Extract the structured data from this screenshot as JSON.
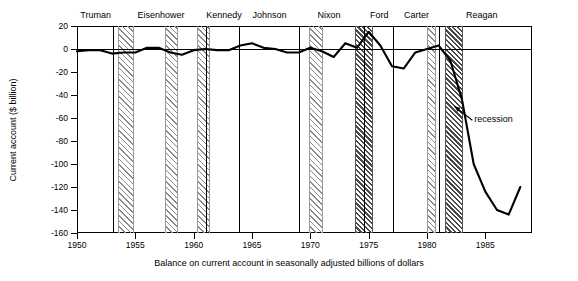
{
  "chart_data": {
    "type": "line",
    "title": "",
    "xlabel": "Balance on current account in seasonally adjusted billions of dollars",
    "ylabel": "Current account ($ billion)",
    "xlim": [
      1950,
      1989
    ],
    "ylim": [
      -160,
      20
    ],
    "xticks": [
      1950,
      1955,
      1960,
      1965,
      1970,
      1975,
      1980,
      1985
    ],
    "yticks": [
      20,
      0,
      -20,
      -40,
      -60,
      -80,
      -100,
      -120,
      -140,
      -160
    ],
    "grid": false,
    "legend": null,
    "annotations": [
      {
        "text": "recession",
        "x": 1983.2,
        "y": -62
      }
    ],
    "series": [
      {
        "name": "Current account balance",
        "x": [
          1950,
          1951,
          1952,
          1953,
          1954,
          1955,
          1956,
          1957,
          1958,
          1959,
          1960,
          1961,
          1962,
          1963,
          1964,
          1965,
          1966,
          1967,
          1968,
          1969,
          1970,
          1971,
          1972,
          1973,
          1974,
          1975,
          1976,
          1977,
          1978,
          1979,
          1980,
          1981,
          1982,
          1983,
          1984,
          1985,
          1986,
          1987,
          1988
        ],
        "values": [
          -2,
          -1,
          -1,
          -4,
          -3,
          -3,
          1,
          1,
          -3,
          -5,
          -1,
          0,
          -1,
          -1,
          3,
          5,
          1,
          0,
          -3,
          -3,
          1,
          -2,
          -7,
          5,
          1,
          15,
          3,
          -15,
          -17,
          -3,
          0,
          3,
          -10,
          -44,
          -100,
          -124,
          -140,
          -144,
          -120
        ]
      }
    ],
    "recessions": [
      {
        "start": 1953.5,
        "end": 1954.7,
        "shade": "light"
      },
      {
        "start": 1957.5,
        "end": 1958.5,
        "shade": "light"
      },
      {
        "start": 1960.3,
        "end": 1961.2,
        "shade": "light"
      },
      {
        "start": 1969.9,
        "end": 1970.9,
        "shade": "light"
      },
      {
        "start": 1973.8,
        "end": 1975.2,
        "shade": "dark"
      },
      {
        "start": 1980.0,
        "end": 1980.6,
        "shade": "light"
      },
      {
        "start": 1981.5,
        "end": 1982.9,
        "shade": "dark"
      }
    ],
    "president_terms": [
      {
        "name": "Truman",
        "start": 1950.0,
        "end": 1953.05,
        "center": 1951.6
      },
      {
        "name": "Eisenhower",
        "start": 1953.05,
        "end": 1961.05,
        "center": 1957.2
      },
      {
        "name": "Kennedy",
        "start": 1961.05,
        "end": 1963.9,
        "center": 1962.6
      },
      {
        "name": "Johnson",
        "start": 1963.9,
        "end": 1969.05,
        "center": 1966.5
      },
      {
        "name": "Nixon",
        "start": 1969.05,
        "end": 1974.6,
        "center": 1971.6
      },
      {
        "name": "Ford",
        "start": 1974.6,
        "end": 1977.05,
        "center": 1975.9
      },
      {
        "name": "Carter",
        "start": 1977.05,
        "end": 1981.05,
        "center": 1979.1
      },
      {
        "name": "Reagan",
        "start": 1981.05,
        "end": 1989.0,
        "center": 1984.7
      }
    ]
  }
}
